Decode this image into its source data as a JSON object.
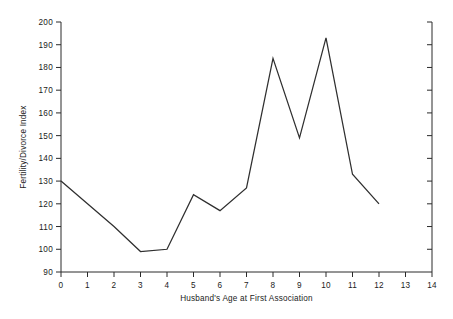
{
  "chart_data": {
    "type": "line",
    "title": "",
    "xlabel": "Husband's Age at First Association",
    "ylabel": "Fertility/Divorce Index",
    "xlim": [
      0,
      14
    ],
    "ylim": [
      90,
      200
    ],
    "xticks": [
      0,
      1,
      2,
      3,
      4,
      5,
      6,
      7,
      8,
      9,
      10,
      11,
      12,
      13,
      14
    ],
    "xtick_labels": [
      "0",
      "1",
      "2",
      "3",
      "4",
      "5",
      "6",
      "7",
      "8",
      "9",
      "10",
      "11",
      "12",
      "13",
      "14"
    ],
    "yticks": [
      90,
      100,
      110,
      120,
      130,
      140,
      150,
      160,
      170,
      180,
      190,
      200
    ],
    "ytick_labels": [
      "90",
      "100",
      "110",
      "120",
      "130",
      "140",
      "150",
      "160",
      "170",
      "180",
      "190",
      "200"
    ],
    "grid": false,
    "legend": false,
    "legend_position": "none",
    "line_color": "#2f2f2f",
    "axis_color": "#2a2a2a",
    "background_color": "#ffffff",
    "x": [
      0,
      1,
      2,
      3,
      4,
      5,
      6,
      7,
      8,
      9,
      10,
      11,
      12
    ],
    "values": [
      130,
      120,
      110,
      99,
      100,
      124,
      117,
      127,
      184,
      149,
      193,
      133,
      120
    ],
    "series": [
      {
        "name": "Fertility/Divorce Index",
        "x": [
          0,
          1,
          2,
          3,
          4,
          5,
          6,
          7,
          8,
          9,
          10,
          11,
          12
        ],
        "values": [
          130,
          120,
          110,
          99,
          100,
          124,
          117,
          127,
          184,
          149,
          193,
          133,
          120
        ]
      }
    ],
    "annotations": []
  }
}
